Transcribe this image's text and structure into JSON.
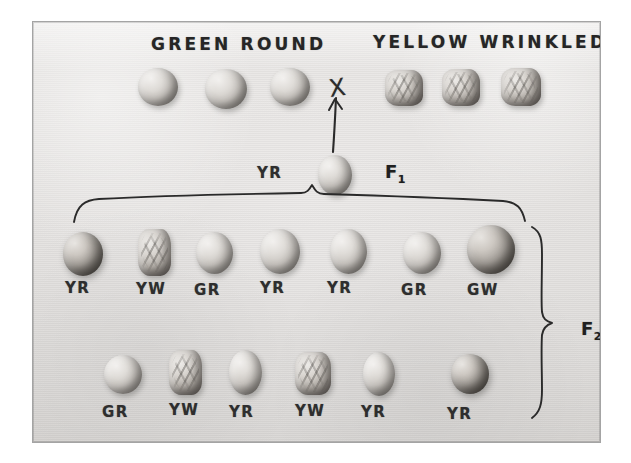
{
  "plate": {
    "title_left": "GREEN ROUND",
    "title_right": "YELLOW WRINKLED",
    "cross_symbol": "X",
    "f1_label": "F",
    "f1_subscript": "1",
    "f1_genotype": "YR",
    "f2_label": "F",
    "f2_subscript": "2",
    "ink_color": "#2a2a2a",
    "background_color": "#e6e4e2",
    "mount_color": "#ffffff"
  },
  "parents": {
    "green_round": [
      {
        "label": "",
        "shape": "round",
        "tone": "light"
      },
      {
        "label": "",
        "shape": "round",
        "tone": "light"
      },
      {
        "label": "",
        "shape": "round",
        "tone": "light"
      }
    ],
    "yellow_wrinkled": [
      {
        "label": "",
        "shape": "wrinkled",
        "tone": "light"
      },
      {
        "label": "",
        "shape": "wrinkled",
        "tone": "dark"
      },
      {
        "label": "",
        "shape": "wrinkled",
        "tone": "dark"
      }
    ]
  },
  "f1": {
    "genotype": "YR",
    "generation": "F",
    "generation_sub": "1",
    "seeds": [
      {
        "label": "",
        "shape": "round",
        "tone": "light"
      }
    ]
  },
  "f2": {
    "generation": "F",
    "generation_sub": "2",
    "row1": [
      {
        "label": "YR",
        "shape": "round",
        "tone": "dark"
      },
      {
        "label": "YW",
        "shape": "wrinkled",
        "tone": "light"
      },
      {
        "label": "GR",
        "shape": "round",
        "tone": "light"
      },
      {
        "label": "YR",
        "shape": "round",
        "tone": "light"
      },
      {
        "label": "YR",
        "shape": "round",
        "tone": "light"
      },
      {
        "label": "GR",
        "shape": "round",
        "tone": "light"
      },
      {
        "label": "GW",
        "shape": "round",
        "tone": "dark"
      }
    ],
    "row2": [
      {
        "label": "GR",
        "shape": "round",
        "tone": "light"
      },
      {
        "label": "YW",
        "shape": "wrinkled",
        "tone": "light"
      },
      {
        "label": "YR",
        "shape": "round",
        "tone": "light"
      },
      {
        "label": "YW",
        "shape": "wrinkled",
        "tone": "light"
      },
      {
        "label": "YR",
        "shape": "round",
        "tone": "light"
      },
      {
        "label": "YR",
        "shape": "round",
        "tone": "dark"
      }
    ]
  }
}
